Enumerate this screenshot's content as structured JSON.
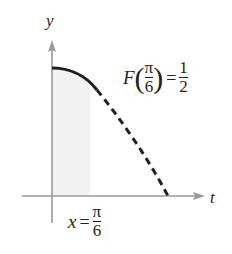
{
  "diagram": {
    "axes": {
      "x_label": "t",
      "y_label": "y"
    },
    "annotations": {
      "function_value": {
        "func": "F",
        "arg_numerator": "π",
        "arg_denominator": "6",
        "equals": "=",
        "value_numerator": "1",
        "value_denominator": "2"
      },
      "x_marker": {
        "var": "x",
        "equals": "=",
        "numerator": "π",
        "denominator": "6"
      }
    },
    "colors": {
      "axis": "#9a9a9a",
      "curve": "#231f20",
      "shade": "#f2f2f2",
      "text": "#231f20"
    }
  }
}
